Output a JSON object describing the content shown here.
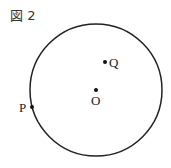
{
  "figure": {
    "label": "図 2",
    "circle": {
      "cx": 96,
      "cy": 90,
      "r": 66,
      "stroke": "#222222"
    },
    "points": [
      {
        "name": "Q",
        "x": 105,
        "y": 62,
        "label_x": 109,
        "label_y": 67
      },
      {
        "name": "O",
        "x": 96,
        "y": 90,
        "label_x": 91,
        "label_y": 105
      },
      {
        "name": "P",
        "x": 32,
        "y": 107,
        "label_x": 19,
        "label_y": 112
      }
    ]
  }
}
